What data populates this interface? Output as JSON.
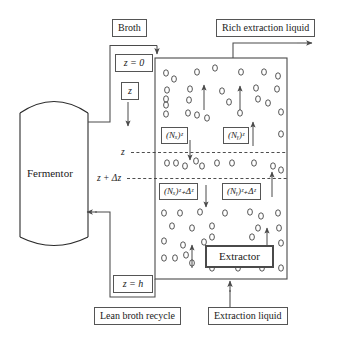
{
  "diagram": {
    "vessel": {
      "name": "Fermentor",
      "label": "Fermentor"
    },
    "column": {
      "name": "extraction-column",
      "inner_box_label": "Extractor"
    },
    "streams": {
      "broth": "Broth",
      "rich_extraction_liquid": "Rich extraction liquid",
      "extraction_liquid": "Extraction liquid",
      "lean_broth_recycle": "Lean broth recycle"
    },
    "position_labels": {
      "z_top": "z = 0",
      "z_var": "z",
      "z_bottom": "z = h"
    },
    "axis_labels": {
      "z": "z",
      "z_plus_dz": "z + Δz"
    },
    "flux_labels": {
      "nx_z": "(Nₓ)ᶻ",
      "ny_z": "(Nᵧ)ᶻ",
      "nx_zdz": "(Nₓ)ᶻ₊Δᶻ",
      "ny_zdz": "(Nᵧ)ᶻ₊Δᶻ"
    },
    "flux_parts": {
      "nx_base": "(N",
      "nx_sub": "x",
      "ny_sub": "y",
      "close": ")",
      "sub_z": "z",
      "sub_zdz": "z+Δz"
    },
    "colors": {
      "line": "#555555",
      "thick_line": "#4a4a4a",
      "bubble": "#3a3a3a",
      "background": "#ffffff"
    },
    "bubbles_count": 64,
    "arrows": {
      "broth_in": "down-arrow",
      "rich_out": "right-arrow",
      "extraction_in": "up-arrow",
      "recycle": "left-arrow",
      "z_depth": "down-arrow",
      "flux_x_z": "down-arrow",
      "flux_y_z": "up-arrow",
      "flux_x_zdz": "down-arrow",
      "flux_y_zdz": "up-arrow"
    }
  }
}
